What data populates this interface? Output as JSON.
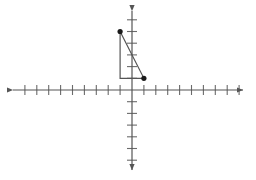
{
  "figure": {
    "title": "Coordinate plane with right triangle",
    "type": "coordinate-plane-figure",
    "background_color": "#ffffff"
  },
  "chart_data": {
    "type": "scatter",
    "title": "",
    "xlabel": "",
    "ylabel": "",
    "grid": false,
    "axes": {
      "x_axis": {
        "label": "",
        "range": [
          -10,
          9
        ],
        "tick_count": 19,
        "tick_labels": [],
        "arrow_start": true,
        "arrow_end": true,
        "color": "#555555"
      },
      "y_axis": {
        "label": "",
        "range": [
          -6,
          6
        ],
        "tick_count": 12,
        "tick_labels": [],
        "arrow_start": true,
        "arrow_end": true,
        "color": "#555555"
      }
    },
    "origin": {
      "x": 0,
      "y": 0
    },
    "shapes": [
      {
        "name": "right-triangle",
        "kind": "polygon",
        "closed": true,
        "stroke_color": "#555555",
        "fill": "none",
        "vertices": [
          {
            "label": "A",
            "x": -1,
            "y": 5,
            "marked": true
          },
          {
            "label": "B",
            "x": -1,
            "y": 1,
            "marked": false
          },
          {
            "label": "C",
            "x": 1,
            "y": 1,
            "marked": true
          }
        ]
      }
    ],
    "points": [
      {
        "label": "A",
        "x": -1,
        "y": 5,
        "color": "#1a1a1a",
        "radius": 2.6
      },
      {
        "label": "C",
        "x": 1,
        "y": 1,
        "color": "#1a1a1a",
        "radius": 2.6
      }
    ],
    "legend": {
      "visible": false,
      "position": "none",
      "entries": []
    },
    "annotations": []
  },
  "geometry": {
    "origin_px": {
      "x": 132,
      "y": 90
    },
    "unit_px": {
      "x": 11.9,
      "y": 11.7
    },
    "x_axis_px": {
      "x1": 13,
      "x2": 243,
      "y": 90
    },
    "y_axis_px": {
      "x": 132,
      "y1": 11,
      "y2": 170
    },
    "tick_half_len_px": {
      "x": 5,
      "y": 5
    },
    "stroke_width": 1.2,
    "axis_color": "#555555",
    "tick_color": "#6b6b6b",
    "shape_color": "#4a4a4a",
    "point_color": "#151515"
  }
}
